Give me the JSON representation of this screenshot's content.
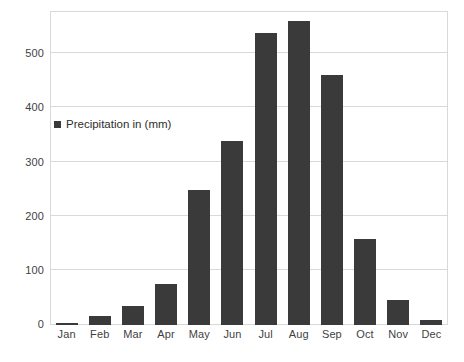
{
  "chart_data": {
    "type": "bar",
    "title": "",
    "subtitle": "",
    "xlabel": "",
    "ylabel": "",
    "categories": [
      "Jan",
      "Feb",
      "Mar",
      "Apr",
      "May",
      "Jun",
      "Jul",
      "Aug",
      "Sep",
      "Oct",
      "Nov",
      "Dec"
    ],
    "series": [
      {
        "name": "Precipitation in (mm)",
        "color": "#3a3a3a",
        "values": [
          4,
          17,
          36,
          75,
          250,
          340,
          539,
          561,
          461,
          158,
          47,
          9
        ]
      }
    ],
    "ylim": [
      0,
      580
    ],
    "yticks": [
      0,
      100,
      200,
      300,
      400,
      500
    ],
    "ytick_labels": [
      "0",
      "100",
      "200",
      "300",
      "400",
      "500"
    ],
    "grid": "horizontal",
    "legend": {
      "position": "inside-upper-left",
      "entries": [
        {
          "label": "Precipitation in (mm)",
          "swatch_color": "#3a3a3a"
        }
      ]
    },
    "axis_color": "#d9d9d9",
    "text_color": "#3f3f3f",
    "background": "#ffffff"
  },
  "legend_entry_label": "Precipitation in (mm)"
}
